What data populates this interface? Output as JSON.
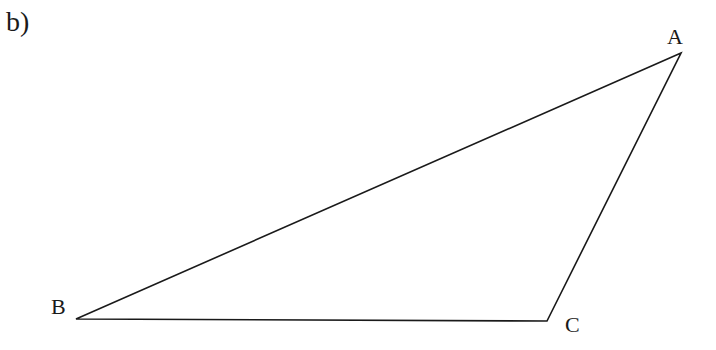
{
  "figure": {
    "part_label": "b)",
    "shape": "triangle",
    "stroke_color": "#1a1a1a",
    "vertices": [
      {
        "name": "A",
        "x": 681,
        "y": 53,
        "label_x": 667,
        "label_y": 26
      },
      {
        "name": "B",
        "x": 76,
        "y": 319,
        "label_x": 51,
        "label_y": 296
      },
      {
        "name": "C",
        "x": 547,
        "y": 321,
        "label_x": 565,
        "label_y": 314
      }
    ]
  }
}
